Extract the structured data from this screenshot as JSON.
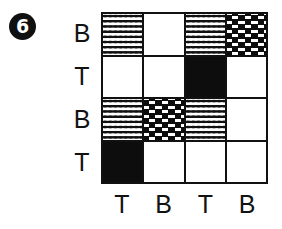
{
  "figure": {
    "badge_number": "6",
    "type": "matrix-grid-puzzle",
    "rows": 4,
    "columns": 4
  },
  "row_labels": [
    {
      "label": "B"
    },
    {
      "label": "T"
    },
    {
      "label": "B"
    },
    {
      "label": "T"
    }
  ],
  "column_labels": [
    {
      "label": "T"
    },
    {
      "label": "B"
    },
    {
      "label": "T"
    },
    {
      "label": "B"
    }
  ],
  "legend": {
    "fills": [
      "white",
      "black",
      "dotted",
      "brick"
    ]
  },
  "grid": {
    "cells": [
      {
        "row": 1,
        "col": 1,
        "fill": "dotted"
      },
      {
        "row": 1,
        "col": 2,
        "fill": "white"
      },
      {
        "row": 1,
        "col": 3,
        "fill": "dotted"
      },
      {
        "row": 1,
        "col": 4,
        "fill": "brick"
      },
      {
        "row": 2,
        "col": 1,
        "fill": "white"
      },
      {
        "row": 2,
        "col": 2,
        "fill": "white"
      },
      {
        "row": 2,
        "col": 3,
        "fill": "black"
      },
      {
        "row": 2,
        "col": 4,
        "fill": "white"
      },
      {
        "row": 3,
        "col": 1,
        "fill": "dotted"
      },
      {
        "row": 3,
        "col": 2,
        "fill": "brick"
      },
      {
        "row": 3,
        "col": 3,
        "fill": "dotted"
      },
      {
        "row": 3,
        "col": 4,
        "fill": "white"
      },
      {
        "row": 4,
        "col": 1,
        "fill": "black"
      },
      {
        "row": 4,
        "col": 2,
        "fill": "white"
      },
      {
        "row": 4,
        "col": 3,
        "fill": "white"
      },
      {
        "row": 4,
        "col": 4,
        "fill": "white"
      }
    ]
  },
  "colors": {
    "ink": "#111111",
    "paper": "#ffffff"
  }
}
